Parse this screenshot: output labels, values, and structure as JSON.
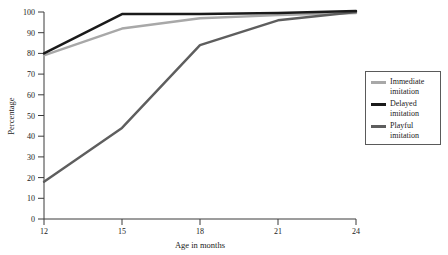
{
  "chart_data": {
    "type": "line",
    "title": "",
    "xlabel": "Age in months",
    "ylabel": "Percentage",
    "x": [
      12,
      15,
      18,
      21,
      24
    ],
    "xtick_labels": [
      "12",
      "15",
      "18",
      "21",
      "24"
    ],
    "ytick_labels": [
      "0",
      "10",
      "20",
      "30",
      "40",
      "50",
      "60",
      "70",
      "80",
      "90",
      "100"
    ],
    "yticks": [
      0,
      10,
      20,
      30,
      40,
      50,
      60,
      70,
      80,
      90,
      100
    ],
    "xlim": [
      12,
      24
    ],
    "ylim": [
      0,
      100
    ],
    "grid": false,
    "legend_position": "right",
    "series": [
      {
        "name": "Immediate\nimitation",
        "label_line1": "Immediate",
        "label_line2": "imitation",
        "color": "#a8a8a8",
        "values": [
          79,
          92,
          97,
          98.5,
          99.5
        ]
      },
      {
        "name": "Delayed\nimitation",
        "label_line1": "Delayed",
        "label_line2": "imitation",
        "color": "#1a1a1a",
        "values": [
          80,
          99,
          99,
          99.5,
          100.5
        ]
      },
      {
        "name": "Playful\nimitation",
        "label_line1": "Playful",
        "label_line2": "imitation",
        "color": "#5e5e5e",
        "values": [
          18,
          44,
          84,
          96,
          100
        ]
      }
    ]
  },
  "axes": {
    "ylabel": "Percentage",
    "xlabel": "Age in months",
    "ytick_0": "0",
    "ytick_10": "10",
    "ytick_20": "20",
    "ytick_30": "30",
    "ytick_40": "40",
    "ytick_50": "50",
    "ytick_60": "60",
    "ytick_70": "70",
    "ytick_80": "80",
    "ytick_90": "90",
    "ytick_100": "100",
    "xtick_12": "12",
    "xtick_15": "15",
    "xtick_18": "18",
    "xtick_21": "21",
    "xtick_24": "24"
  },
  "legend": {
    "items": [
      {
        "line1": "Immediate",
        "line2": "imitation",
        "color": "#a8a8a8"
      },
      {
        "line1": "Delayed",
        "line2": "imitation",
        "color": "#1a1a1a"
      },
      {
        "line1": "Playful",
        "line2": "imitation",
        "color": "#5e5e5e"
      }
    ]
  },
  "colors": {
    "axis": "#3a3a3a",
    "text": "#1a1a1a",
    "background": "#ffffff",
    "immediate": "#a8a8a8",
    "delayed": "#1a1a1a",
    "playful": "#5e5e5e"
  }
}
